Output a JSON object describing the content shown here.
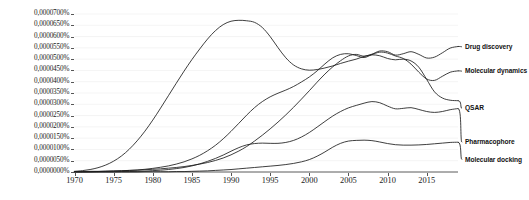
{
  "chart_data": {
    "type": "line",
    "title": "",
    "xlabel": "",
    "ylabel": "",
    "xlim": [
      1970,
      2019
    ],
    "ylim": [
      0.0,
      7e-05
    ],
    "grid": false,
    "legend_position": "right-inline-labels",
    "y_tick_labels": [
      "0,0000700%",
      "0,0000650%",
      "0,0000600%",
      "0,0000550%",
      "0,0000500%",
      "0,0000450%",
      "0,0000400%",
      "0,0000350%",
      "0,0000300%",
      "0,0000250%",
      "0,0000200%",
      "0,0000150%",
      "0,0000100%",
      "0,0000050%",
      "0,0000000%"
    ],
    "y_tick_values": [
      7e-05,
      6.5e-05,
      6e-05,
      5.5e-05,
      5e-05,
      4.5e-05,
      4e-05,
      3.5e-05,
      3e-05,
      2.5e-05,
      2e-05,
      1.5e-05,
      1e-05,
      5e-06,
      0.0
    ],
    "x_tick_labels": [
      "1970",
      "1975",
      "1980",
      "1985",
      "1990",
      "1995",
      "2000",
      "2005",
      "2010",
      "2015"
    ],
    "x_tick_values": [
      1970,
      1975,
      1980,
      1985,
      1990,
      1995,
      2000,
      2005,
      2010,
      2015
    ],
    "x": [
      1970,
      1971,
      1972,
      1973,
      1974,
      1975,
      1976,
      1977,
      1978,
      1979,
      1980,
      1981,
      1982,
      1983,
      1984,
      1985,
      1986,
      1987,
      1988,
      1989,
      1990,
      1991,
      1992,
      1993,
      1994,
      1995,
      1996,
      1997,
      1998,
      1999,
      2000,
      2001,
      2002,
      2003,
      2004,
      2005,
      2006,
      2007,
      2008,
      2009,
      2010,
      2011,
      2012,
      2013,
      2014,
      2015,
      2016,
      2017,
      2018,
      2019
    ],
    "series": [
      {
        "name": "Drug discovery",
        "label_y_value": 5.55e-05,
        "values": [
          2e-07,
          2e-07,
          3e-07,
          3e-07,
          4e-07,
          5e-07,
          6e-07,
          7e-07,
          8e-07,
          1e-06,
          1.2e-06,
          1.4e-06,
          1.7e-06,
          2e-06,
          2.4e-06,
          2.9e-06,
          3.5e-06,
          4.2e-06,
          5.1e-06,
          6.2e-06,
          7.6e-06,
          9.3e-06,
          1.13e-05,
          1.37e-05,
          1.63e-05,
          1.91e-05,
          2.21e-05,
          2.53e-05,
          2.87e-05,
          3.23e-05,
          3.6e-05,
          3.98e-05,
          4.34e-05,
          4.66e-05,
          4.93e-05,
          5.14e-05,
          5.21e-05,
          5.13e-05,
          5.22e-05,
          5.36e-05,
          5.33e-05,
          5.18e-05,
          5.24e-05,
          5.33e-05,
          5.21e-05,
          5.05e-05,
          5.09e-05,
          5.28e-05,
          5.49e-05,
          5.56e-05
        ]
      },
      {
        "name": "Molecular dynamics",
        "label_y_value": 4.47e-05,
        "values": [
          1e-07,
          1e-07,
          2e-07,
          2e-07,
          3e-07,
          4e-07,
          5e-07,
          7e-07,
          9e-07,
          1.2e-06,
          1.6e-06,
          2.1e-06,
          2.7e-06,
          3.5e-06,
          4.5e-06,
          5.8e-06,
          7.4e-06,
          9.4e-06,
          1.18e-05,
          1.47e-05,
          1.8e-05,
          2.16e-05,
          2.52e-05,
          2.85e-05,
          3.12e-05,
          3.33e-05,
          3.49e-05,
          3.63e-05,
          3.79e-05,
          3.99e-05,
          4.21e-05,
          4.48e-05,
          4.79e-05,
          5.06e-05,
          5.21e-05,
          5.24e-05,
          5.16e-05,
          5.07e-05,
          5.2e-05,
          5.31e-05,
          5.27e-05,
          5.14e-05,
          5.03e-05,
          4.78e-05,
          4.42e-05,
          4.12e-05,
          4.06e-05,
          4.24e-05,
          4.42e-05,
          4.48e-05
        ]
      },
      {
        "name": "QSAR",
        "label_y_value": 2.82e-05,
        "values": [
          3e-07,
          6e-07,
          1.1e-06,
          1.9e-06,
          3.1e-06,
          4.8e-06,
          7.1e-06,
          1.01e-05,
          1.38e-05,
          1.81e-05,
          2.3e-05,
          2.83e-05,
          3.38e-05,
          3.93e-05,
          4.47e-05,
          4.98e-05,
          5.45e-05,
          5.89e-05,
          6.26e-05,
          6.53e-05,
          6.68e-05,
          6.72e-05,
          6.7e-05,
          6.63e-05,
          6.4e-05,
          6e-05,
          5.51e-05,
          5.06e-05,
          4.74e-05,
          4.57e-05,
          4.51e-05,
          4.54e-05,
          4.61e-05,
          4.7e-05,
          4.81e-05,
          4.91e-05,
          5e-05,
          5.12e-05,
          5.19e-05,
          5.15e-05,
          5.03e-05,
          4.97e-05,
          5e-05,
          4.92e-05,
          4.64e-05,
          4.1e-05,
          3.55e-05,
          3.28e-05,
          3.18e-05,
          3.16e-05
        ]
      },
      {
        "name": "Pharmacophore",
        "label_y_value": 1.32e-05,
        "values": [
          0.0,
          0.0,
          0.0,
          1e-07,
          1e-07,
          1e-07,
          2e-07,
          2e-07,
          3e-07,
          4e-07,
          6e-07,
          8e-07,
          1.1e-06,
          1.5e-06,
          2e-06,
          2.7e-06,
          3.6e-06,
          4.7e-06,
          6e-06,
          7.5e-06,
          9.2e-06,
          1.08e-05,
          1.2e-05,
          1.26e-05,
          1.28e-05,
          1.27e-05,
          1.27e-05,
          1.31e-05,
          1.4e-05,
          1.55e-05,
          1.75e-05,
          1.99e-05,
          2.24e-05,
          2.48e-05,
          2.68e-05,
          2.84e-05,
          2.95e-05,
          3.05e-05,
          3.12e-05,
          3.07e-05,
          2.92e-05,
          2.8e-05,
          2.82e-05,
          2.85e-05,
          2.77e-05,
          2.68e-05,
          2.64e-05,
          2.68e-05,
          2.76e-05,
          2.81e-05
        ]
      },
      {
        "name": "Molecular docking",
        "label_y_value": 5.5e-06,
        "values": [
          0.0,
          0.0,
          0.0,
          0.0,
          0.0,
          0.0,
          0.0,
          0.0,
          0.0,
          1e-07,
          1e-07,
          1e-07,
          1e-07,
          2e-07,
          2e-07,
          3e-07,
          4e-07,
          5e-07,
          7e-07,
          9e-07,
          1.1e-06,
          1.4e-06,
          1.7e-06,
          2e-06,
          2.3e-06,
          2.6e-06,
          2.9e-06,
          3.3e-06,
          3.8e-06,
          4.5e-06,
          5.5e-06,
          7e-06,
          8.9e-06,
          1.1e-05,
          1.27e-05,
          1.37e-05,
          1.4e-05,
          1.41e-05,
          1.39e-05,
          1.33e-05,
          1.26e-05,
          1.21e-05,
          1.19e-05,
          1.19e-05,
          1.2e-05,
          1.22e-05,
          1.25e-05,
          1.28e-05,
          1.31e-05,
          1.32e-05
        ]
      }
    ]
  },
  "colors": {
    "line": "#1c1c1c",
    "axis": "#5a5a5a",
    "text": "#1a1a1a",
    "background": "#ffffff"
  }
}
